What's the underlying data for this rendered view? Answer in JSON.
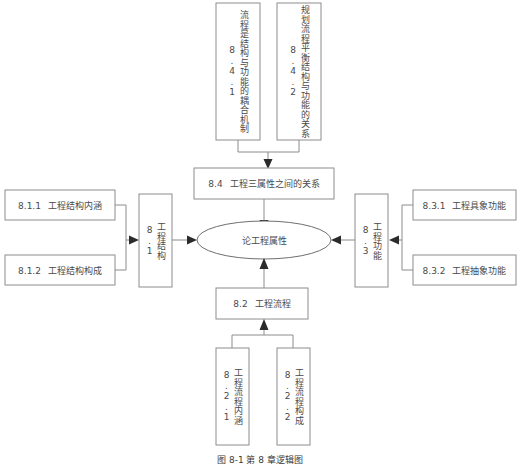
{
  "figure": {
    "caption": "图 8-1    第 8 章逻辑图",
    "width": 520,
    "height": 468,
    "colors": {
      "background": "#ffffff",
      "box_border": "#8c8c8c",
      "ellipse_border": "#6e6e6e",
      "text": "#4a4a4a",
      "arrow": "#2b2b2b"
    }
  },
  "center": {
    "id": "lun-gong-cheng-shu-xing",
    "label": "论工程属性",
    "shape": "ellipse"
  },
  "nodes": {
    "top_children": [
      {
        "id": "8.4.1",
        "number": "8.4.1",
        "label": "流程是结构与功能的耦合机制",
        "orientation": "vertical"
      },
      {
        "id": "8.4.2",
        "number": "8.4.2",
        "label": "规划流程平衡结构与功能的关系",
        "orientation": "vertical"
      }
    ],
    "top_parent": {
      "id": "8.4",
      "number": "8.4",
      "label": "工程三属性之间的关系",
      "orientation": "horizontal"
    },
    "left_children": [
      {
        "id": "8.1.1",
        "number": "8.1.1",
        "label": "工程结构内涵",
        "orientation": "horizontal"
      },
      {
        "id": "8.1.2",
        "number": "8.1.2",
        "label": "工程结构构成",
        "orientation": "horizontal"
      }
    ],
    "left_parent": {
      "id": "8.1",
      "number": "8.1",
      "label": "工程结构",
      "orientation": "vertical"
    },
    "right_children": [
      {
        "id": "8.3.1",
        "number": "8.3.1",
        "label": "工程具象功能",
        "orientation": "horizontal"
      },
      {
        "id": "8.3.2",
        "number": "8.3.2",
        "label": "工程抽象功能",
        "orientation": "horizontal"
      }
    ],
    "right_parent": {
      "id": "8.3",
      "number": "8.3",
      "label": "工程功能",
      "orientation": "vertical"
    },
    "bottom_parent": {
      "id": "8.2",
      "number": "8.2",
      "label": "工程流程",
      "orientation": "horizontal"
    },
    "bottom_children": [
      {
        "id": "8.2.1",
        "number": "8.2.1",
        "label": "工程流程内涵",
        "orientation": "vertical"
      },
      {
        "id": "8.2.2",
        "number": "8.2.2",
        "label": "工程流程构成",
        "orientation": "vertical"
      }
    ]
  },
  "edges": [
    {
      "from": "8.4.1",
      "to": "8.4",
      "direction": "down"
    },
    {
      "from": "8.4.2",
      "to": "8.4",
      "direction": "down"
    },
    {
      "from": "8.4",
      "to": "center",
      "direction": "down"
    },
    {
      "from": "8.1.1",
      "to": "8.1",
      "direction": "right"
    },
    {
      "from": "8.1.2",
      "to": "8.1",
      "direction": "right"
    },
    {
      "from": "8.1",
      "to": "center",
      "direction": "right"
    },
    {
      "from": "8.3.1",
      "to": "8.3",
      "direction": "left"
    },
    {
      "from": "8.3.2",
      "to": "8.3",
      "direction": "left"
    },
    {
      "from": "8.3",
      "to": "center",
      "direction": "left"
    },
    {
      "from": "8.2.1",
      "to": "8.2",
      "direction": "up"
    },
    {
      "from": "8.2.2",
      "to": "8.2",
      "direction": "up"
    },
    {
      "from": "8.2",
      "to": "center",
      "direction": "up"
    }
  ]
}
